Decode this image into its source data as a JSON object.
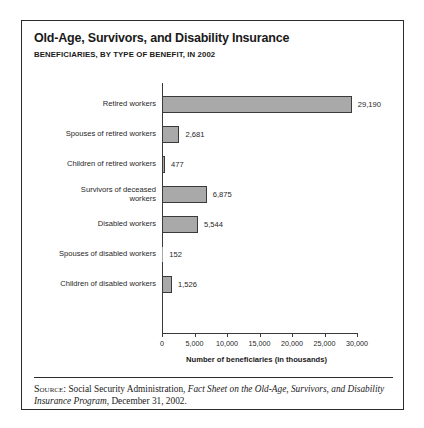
{
  "figure": {
    "title": "Old-Age, Survivors, and Disability Insurance",
    "subtitle": "BENEFICIARIES, BY TYPE OF BENEFIT, IN 2002"
  },
  "source": {
    "label": "Source:",
    "text_before": " Social Security Administration, ",
    "italic_title": "Fact Sheet on the Old-Age, Survivors, and Disability Insurance Program",
    "text_after": ", December 31, 2002."
  },
  "chart_data": {
    "type": "bar",
    "orientation": "horizontal",
    "title": "Old-Age, Survivors, and Disability Insurance",
    "subtitle": "BENEFICIARIES, BY TYPE OF BENEFIT, IN 2002",
    "xlabel": "Number of beneficiaries (in thousands)",
    "ylabel": "",
    "xlim": [
      0,
      30000
    ],
    "xticks": [
      0,
      5000,
      10000,
      15000,
      20000,
      25000,
      30000
    ],
    "xtick_labels": [
      "0",
      "5,000",
      "10,000",
      "15,000",
      "20,000",
      "25,000",
      "30,000"
    ],
    "grid": false,
    "legend": false,
    "bar_color": "#a9a9a9",
    "bar_edge_color": "#3a3a3a",
    "categories": [
      "Retired workers",
      "Spouses of retired workers",
      "Children of retired workers",
      "Survivors of deceased workers",
      "Disabled workers",
      "Spouses of disabled workers",
      "Children of disabled workers"
    ],
    "values": [
      29190,
      2681,
      477,
      6875,
      5544,
      152,
      1526
    ],
    "value_labels": [
      "29,190",
      "2,681",
      "477",
      "6,875",
      "5,544",
      "152",
      "1,526"
    ],
    "category_lines": [
      [
        "Retired workers"
      ],
      [
        "Spouses of retired workers"
      ],
      [
        "Children of retired workers"
      ],
      [
        "Survivors of deceased",
        "workers"
      ],
      [
        "Disabled workers"
      ],
      [
        "Spouses of disabled workers"
      ],
      [
        "Children of disabled workers"
      ]
    ]
  }
}
